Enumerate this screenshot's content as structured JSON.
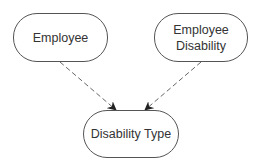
{
  "diagram": {
    "nodes": [
      {
        "id": "employee",
        "lines": [
          "Employee"
        ]
      },
      {
        "id": "employee-disability",
        "lines": [
          "Employee",
          "Disability"
        ]
      },
      {
        "id": "disability-type",
        "lines": [
          "Disability Type"
        ]
      }
    ],
    "edges": [
      {
        "from": "employee",
        "to": "disability-type",
        "style": "dashed",
        "arrow": "end"
      },
      {
        "from": "employee-disability",
        "to": "disability-type",
        "style": "dashed",
        "arrow": "end"
      }
    ],
    "colors": {
      "stroke": "#555555",
      "text": "#333333",
      "background": "#ffffff"
    }
  }
}
